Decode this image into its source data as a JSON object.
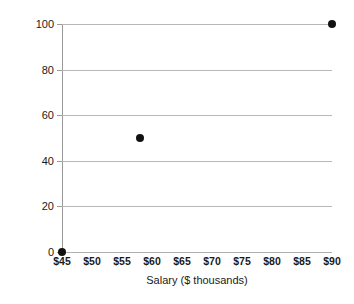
{
  "chart_data": {
    "type": "scatter",
    "title": "",
    "xlabel": "Salary ($ thousands)",
    "ylabel": "Utility",
    "xlim": [
      45,
      90
    ],
    "ylim": [
      0,
      100
    ],
    "grid": true,
    "legend": false,
    "x_tick_labels": [
      "$45",
      "$50",
      "$55",
      "$60",
      "$65",
      "$70",
      "$75",
      "$80",
      "$85",
      "$90"
    ],
    "x_ticks": [
      45,
      50,
      55,
      60,
      65,
      70,
      75,
      80,
      85,
      90
    ],
    "y_tick_labels": [
      "0",
      "20",
      "40",
      "60",
      "80",
      "100"
    ],
    "y_ticks": [
      0,
      20,
      40,
      60,
      80,
      100
    ],
    "points": [
      {
        "x": 45,
        "y": 0
      },
      {
        "x": 58,
        "y": 50
      },
      {
        "x": 90,
        "y": 100
      }
    ],
    "marker": {
      "shape": "circle",
      "color": "#111111",
      "size": 8
    },
    "gridline_color": "#b8b8b8",
    "axis_color": "#9a9a9a",
    "background": "#ffffff"
  }
}
